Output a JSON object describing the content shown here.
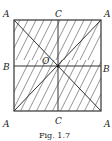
{
  "figure": {
    "caption": "Fig. 1.7",
    "labels": {
      "top_left": "A",
      "top_mid": "C",
      "top_right": "A",
      "mid_left": "B",
      "center": "O",
      "mid_right": "B",
      "bottom_left": "A",
      "bottom_mid": "C",
      "bottom_right": "A"
    },
    "colors": {
      "line": "#333333",
      "hatch": "#555555",
      "background": "#ffffff"
    }
  }
}
